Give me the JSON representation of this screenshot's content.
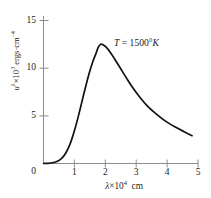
{
  "chart_data": {
    "type": "line",
    "title": "",
    "subtitle": "",
    "xlabel": "λ×10⁴ cm",
    "ylabel": "uλ×10³ ergs·cm⁻⁴",
    "xlabel_parts": {
      "sym": "λ",
      "times": "×",
      "base": "10",
      "exp": "4",
      "unit": "cm"
    },
    "ylabel_parts": {
      "sym": "u",
      "sub": "λ",
      "times": "×",
      "base": "10",
      "exp": "3",
      "unit": "ergs·cm",
      "unit_exp": "−4"
    },
    "xlim": [
      0,
      5.2
    ],
    "ylim": [
      0,
      16.2
    ],
    "xticks": [
      0,
      1,
      2,
      3,
      4,
      5
    ],
    "xtick_labels": [
      "0",
      "1",
      "2",
      "3",
      "4",
      "5"
    ],
    "yticks": [
      0,
      5,
      10,
      15
    ],
    "ytick_labels": [
      "0",
      "5",
      "10",
      "15"
    ],
    "grid": false,
    "legend": "none",
    "annotations": [
      {
        "text": "T = 1500°K",
        "sym": "T",
        "eq": "=",
        "value": "1500",
        "deg": "°",
        "scale": "K",
        "x": 2.6,
        "y": 12.0
      }
    ],
    "series": [
      {
        "name": "Planck spectral energy density at 1500 K",
        "color": "#111111",
        "x": [
          0.0,
          0.15,
          0.3,
          0.45,
          0.55,
          0.65,
          0.75,
          0.85,
          0.95,
          1.05,
          1.15,
          1.25,
          1.35,
          1.45,
          1.55,
          1.65,
          1.75,
          1.85,
          1.93,
          2.0,
          2.1,
          2.25,
          2.4,
          2.6,
          2.8,
          3.0,
          3.25,
          3.5,
          3.75,
          4.0,
          4.25,
          4.5,
          4.75,
          5.0
        ],
        "values": [
          0.0,
          0.02,
          0.08,
          0.22,
          0.4,
          0.7,
          1.15,
          1.8,
          2.65,
          3.7,
          4.9,
          6.2,
          7.55,
          8.85,
          10.05,
          11.1,
          11.95,
          12.8,
          13.1,
          13.05,
          12.8,
          12.2,
          11.45,
          10.4,
          9.35,
          8.35,
          7.25,
          6.3,
          5.55,
          4.9,
          4.35,
          3.9,
          3.45,
          3.05
        ]
      }
    ],
    "peak": {
      "x": 1.93,
      "y": 13.1
    },
    "endpoint": {
      "x": 5.0,
      "y": 3.05
    }
  },
  "axes": {
    "y_axis_name": "vertical-axis-line",
    "x_axis_name": "horizontal-axis-line"
  }
}
